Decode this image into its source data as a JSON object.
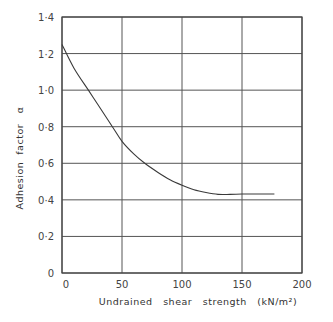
{
  "chart_data": {
    "type": "line",
    "title": "",
    "xlabel": "Undrained   shear   strength   (kN/m²)",
    "ylabel": "Adhesion  factor   α",
    "xlim": [
      0,
      200
    ],
    "ylim": [
      0,
      1.4
    ],
    "x_ticks": [
      0,
      50,
      100,
      150,
      200
    ],
    "x_tick_labels": [
      "0",
      "50",
      "100",
      "150",
      "200"
    ],
    "y_ticks": [
      0,
      0.2,
      0.4,
      0.6,
      0.8,
      1.0,
      1.2,
      1.4
    ],
    "y_tick_labels": [
      "0",
      "0·2",
      "0·4",
      "0·6",
      "0·8",
      "1·0",
      "1·2",
      "1·4"
    ],
    "grid": true,
    "legend": null,
    "series": [
      {
        "name": "Adhesion factor α",
        "x": [
          0,
          10,
          22,
          30,
          42,
          50,
          60,
          69,
          80,
          90,
          100,
          110,
          120,
          130,
          140,
          150,
          160,
          177
        ],
        "y": [
          1.25,
          1.12,
          1.0,
          0.92,
          0.8,
          0.72,
          0.65,
          0.6,
          0.55,
          0.51,
          0.48,
          0.455,
          0.44,
          0.43,
          0.43,
          0.432,
          0.432,
          0.432
        ]
      }
    ]
  }
}
